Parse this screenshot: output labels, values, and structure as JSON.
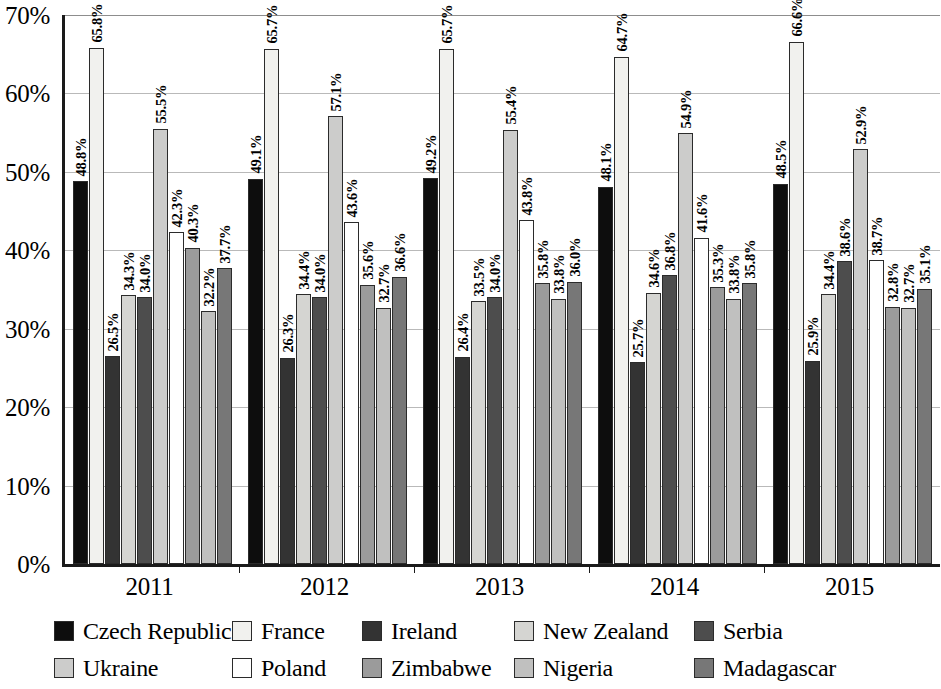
{
  "chart_data": {
    "type": "bar",
    "title": "",
    "xlabel": "",
    "ylabel": "",
    "ylim": [
      0,
      70
    ],
    "ytick_step": 10,
    "grid": true,
    "legend_position": "bottom",
    "categories": [
      "2011",
      "2012",
      "2013",
      "2014",
      "2015"
    ],
    "ytick_labels": [
      "0%",
      "10%",
      "20%",
      "30%",
      "40%",
      "50%",
      "60%",
      "70%"
    ],
    "ytick_values": [
      0,
      10,
      20,
      30,
      40,
      50,
      60,
      70
    ],
    "value_suffix": "%",
    "series": [
      {
        "name": "Czech Republic",
        "color": "#0d0d0d",
        "values": [
          48.8,
          49.1,
          49.2,
          48.1,
          48.5
        ],
        "labels": [
          "48.8%",
          "49.1%",
          "49.2%",
          "48.1%",
          "48.5%"
        ]
      },
      {
        "name": "France",
        "color": "#f1f1ee",
        "values": [
          65.8,
          65.7,
          65.7,
          64.7,
          66.6
        ],
        "labels": [
          "65.8%",
          "65.7%",
          "65.7%",
          "64.7%",
          "66.6%"
        ]
      },
      {
        "name": "Ireland",
        "color": "#333333",
        "values": [
          26.5,
          26.3,
          26.4,
          25.7,
          25.9
        ],
        "labels": [
          "26.5%",
          "26.3%",
          "26.4%",
          "25.7%",
          "25.9%"
        ]
      },
      {
        "name": "New Zealand",
        "color": "#d5d5d2",
        "values": [
          34.3,
          34.4,
          33.5,
          34.6,
          34.4
        ],
        "labels": [
          "34.3%",
          "34.4%",
          "33.5%",
          "34.6%",
          "34.4%"
        ]
      },
      {
        "name": "Serbia",
        "color": "#4d4d4d",
        "values": [
          34.0,
          34.0,
          34.0,
          36.8,
          38.6
        ],
        "labels": [
          "34.0%",
          "34.0%",
          "34.0%",
          "36.8%",
          "38.6%"
        ]
      },
      {
        "name": "Ukraine",
        "color": "#cccccb",
        "values": [
          55.5,
          57.1,
          55.4,
          54.9,
          52.9
        ],
        "labels": [
          "55.5%",
          "57.1%",
          "55.4%",
          "54.9%",
          "52.9%"
        ]
      },
      {
        "name": "Poland",
        "color": "#ffffff",
        "values": [
          42.3,
          43.6,
          43.8,
          41.6,
          38.7
        ],
        "labels": [
          "42.3%",
          "43.6%",
          "43.8%",
          "41.6%",
          "38.7%"
        ]
      },
      {
        "name": "Zimbabwe",
        "color": "#9b9b9b",
        "values": [
          40.3,
          35.6,
          35.8,
          35.3,
          32.8
        ],
        "labels": [
          "40.3%",
          "35.6%",
          "35.8%",
          "35.3%",
          "32.8%"
        ]
      },
      {
        "name": "Nigeria",
        "color": "#c0c0bf",
        "values": [
          32.2,
          32.7,
          33.8,
          33.8,
          32.7
        ],
        "labels": [
          "32.2%",
          "32.7%",
          "33.8%",
          "33.8%",
          "32.7%"
        ]
      },
      {
        "name": "Madagascar",
        "color": "#777777",
        "values": [
          37.7,
          36.6,
          36.0,
          35.8,
          35.1
        ],
        "labels": [
          "37.7%",
          "36.6%",
          "36.0%",
          "35.8%",
          "35.1%"
        ]
      }
    ]
  },
  "legend": {
    "items": [
      {
        "label": "Czech Republic",
        "color": "#0d0d0d"
      },
      {
        "label": "France",
        "color": "#f1f1ee"
      },
      {
        "label": "Ireland",
        "color": "#333333"
      },
      {
        "label": "New Zealand",
        "color": "#d5d5d2"
      },
      {
        "label": "Serbia",
        "color": "#4d4d4d"
      },
      {
        "label": "Ukraine",
        "color": "#cccccb"
      },
      {
        "label": "Poland",
        "color": "#ffffff"
      },
      {
        "label": "Zimbabwe",
        "color": "#9b9b9b"
      },
      {
        "label": "Nigeria",
        "color": "#c0c0bf"
      },
      {
        "label": "Madagascar",
        "color": "#777777"
      }
    ]
  }
}
